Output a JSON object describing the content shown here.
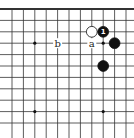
{
  "diagram": {
    "type": "go-board-fragment",
    "grid": {
      "columns": 11,
      "rows": 11,
      "top_edge": true,
      "x0": 12,
      "y0": 9,
      "spacing": 11.4
    },
    "star_points": [
      {
        "col": 2,
        "row": 3
      },
      {
        "col": 8,
        "row": 3
      },
      {
        "col": 2,
        "row": 9
      },
      {
        "col": 8,
        "row": 9
      }
    ],
    "stones": [
      {
        "color": "white",
        "col": 7,
        "row": 2,
        "label": ""
      },
      {
        "color": "black",
        "col": 8,
        "row": 2,
        "label": "1"
      },
      {
        "color": "black",
        "col": 9,
        "row": 3,
        "label": ""
      },
      {
        "color": "black",
        "col": 8,
        "row": 5,
        "label": ""
      }
    ],
    "markers": [
      {
        "text": "b",
        "col": 4,
        "row": 3
      },
      {
        "text": "a",
        "col": 7,
        "row": 3
      }
    ],
    "colors": {
      "line": "#333333",
      "black_stone": "#111111",
      "white_stone": "#ffffff"
    }
  }
}
